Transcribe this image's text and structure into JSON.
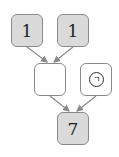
{
  "diagram": {
    "nodes": {
      "top_left": {
        "label": "1",
        "style": "filled"
      },
      "top_right": {
        "label": "1",
        "style": "filled"
      },
      "mid_left": {
        "label": "",
        "style": "empty"
      },
      "mid_right": {
        "label": "ㄱ",
        "style": "empty",
        "marker": "circled"
      },
      "bottom": {
        "label": "7",
        "style": "filled"
      }
    },
    "edges": [
      {
        "from": "top_left",
        "to": "mid_left"
      },
      {
        "from": "top_right",
        "to": "mid_left"
      },
      {
        "from": "mid_left",
        "to": "bottom"
      },
      {
        "from": "mid_right",
        "to": "bottom"
      }
    ],
    "colors": {
      "filled": "#dadada",
      "border": "#8a8a8a",
      "arrow": "#8a8a8a"
    }
  }
}
